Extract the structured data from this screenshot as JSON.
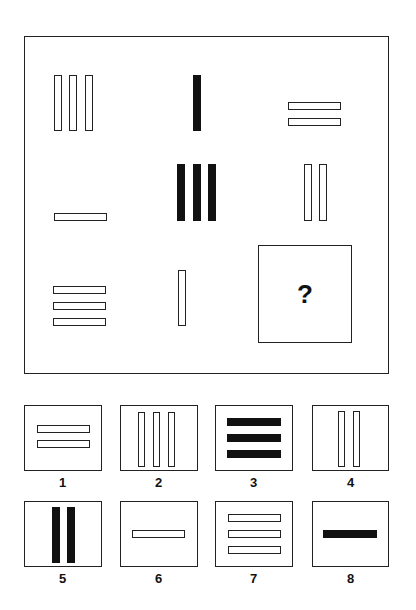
{
  "puzzle": {
    "question_mark": "?",
    "grid": [
      {
        "row": 1,
        "col": 1,
        "description": "three vertical outlined bars"
      },
      {
        "row": 1,
        "col": 2,
        "description": "one vertical filled bar"
      },
      {
        "row": 1,
        "col": 3,
        "description": "two horizontal outlined bars"
      },
      {
        "row": 2,
        "col": 1,
        "description": "one horizontal outlined bar"
      },
      {
        "row": 2,
        "col": 2,
        "description": "three vertical filled bars"
      },
      {
        "row": 2,
        "col": 3,
        "description": "two vertical outlined bars"
      },
      {
        "row": 3,
        "col": 1,
        "description": "three horizontal outlined bars"
      },
      {
        "row": 3,
        "col": 2,
        "description": "one vertical outlined bar"
      },
      {
        "row": 3,
        "col": 3,
        "description": "missing"
      }
    ]
  },
  "options": [
    {
      "label": "1",
      "description": "two horizontal outlined bars"
    },
    {
      "label": "2",
      "description": "three vertical outlined bars"
    },
    {
      "label": "3",
      "description": "three horizontal filled bars"
    },
    {
      "label": "4",
      "description": "two vertical outlined bars"
    },
    {
      "label": "5",
      "description": "two vertical filled bars"
    },
    {
      "label": "6",
      "description": "one horizontal outlined bar"
    },
    {
      "label": "7",
      "description": "three horizontal outlined bars"
    },
    {
      "label": "8",
      "description": "one horizontal filled bar"
    }
  ],
  "colors": {
    "line": "#222222",
    "fill": "#111111",
    "background": "#ffffff"
  }
}
